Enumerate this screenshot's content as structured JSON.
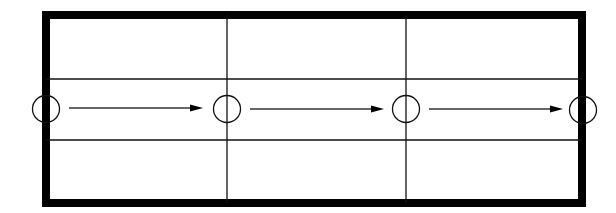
{
  "diagram": {
    "width": 616,
    "height": 213,
    "background": "#ffffff",
    "stroke_color": "#000000",
    "frame": {
      "x": 42,
      "y": 11,
      "width": 544,
      "height": 196,
      "border_width": 8
    },
    "horizontal_lines": [
      {
        "y": 79,
        "x1": 46,
        "x2": 582
      },
      {
        "y": 140,
        "x1": 46,
        "x2": 582
      }
    ],
    "vertical_lines": [
      {
        "x": 227,
        "y1": 15,
        "y2": 203
      },
      {
        "x": 406,
        "y1": 15,
        "y2": 203
      }
    ],
    "nodes": [
      {
        "cx": 46,
        "cy": 109,
        "r": 13.5
      },
      {
        "cx": 227,
        "cy": 109,
        "r": 13.5
      },
      {
        "cx": 406,
        "cy": 109,
        "r": 13.5
      },
      {
        "cx": 583,
        "cy": 110,
        "r": 13.5
      }
    ],
    "arrows": [
      {
        "x1": 69,
        "x2": 203,
        "y": 108
      },
      {
        "x1": 250,
        "x2": 384,
        "y": 109
      },
      {
        "x1": 429,
        "x2": 563,
        "y": 109
      }
    ],
    "arrow_head": {
      "length": 13,
      "half_height": 3.5
    }
  }
}
